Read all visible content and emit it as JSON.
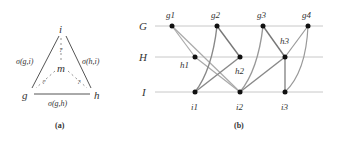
{
  "panel_a": {
    "caption": "(a)",
    "nodes": {
      "i": "i",
      "g": "g",
      "h": "h",
      "m": "m"
    },
    "edge_labels": {
      "gi": "σ(g,i)",
      "hi": "σ(h,i)",
      "gh": "σ(g,h)"
    },
    "unknown": "?"
  },
  "panel_b": {
    "caption": "(b)",
    "rows": [
      "G",
      "H",
      "I"
    ],
    "g_nodes": [
      "g1",
      "g2",
      "g3",
      "g4"
    ],
    "h_nodes": [
      "h1",
      "h2",
      "h3"
    ],
    "i_nodes": [
      "i1",
      "i2",
      "i3"
    ],
    "edges": [
      [
        "g1",
        "h1"
      ],
      [
        "g1",
        "i2"
      ],
      [
        "h1",
        "i2"
      ],
      [
        "g2",
        "i1"
      ],
      [
        "g2",
        "h2"
      ],
      [
        "h2",
        "i1"
      ],
      [
        "g3",
        "i2"
      ],
      [
        "g3",
        "h3"
      ],
      [
        "h3",
        "i2"
      ],
      [
        "g4",
        "h3"
      ],
      [
        "g4",
        "i3"
      ],
      [
        "h3",
        "i3"
      ]
    ]
  }
}
